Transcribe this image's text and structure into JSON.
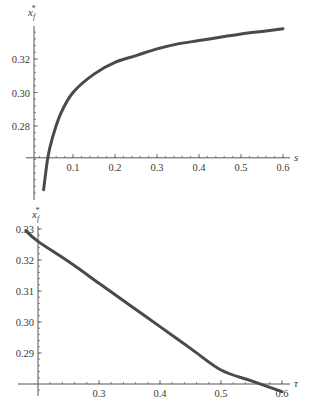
{
  "chart_data": [
    {
      "type": "line",
      "title": "",
      "xlabel": "s",
      "ylabel": "x_f^*",
      "xlim": [
        0.0,
        0.6
      ],
      "ylim": [
        0.24,
        0.34
      ],
      "axis_origin": {
        "x": 0.0,
        "y": 0.261
      },
      "x_ticks": [
        0.1,
        0.2,
        0.3,
        0.4,
        0.5,
        0.6
      ],
      "x_tick_labels": [
        "0.1",
        "0.2",
        "0.3",
        "0.4",
        "0.5",
        "0.6"
      ],
      "y_ticks": [
        0.28,
        0.3,
        0.32
      ],
      "y_tick_labels": [
        "0.28",
        "0.30",
        "0.32"
      ],
      "grid": false,
      "legend": null,
      "series": [
        {
          "name": "x_f^*(s)",
          "x": [
            0.03,
            0.04,
            0.05,
            0.07,
            0.1,
            0.15,
            0.2,
            0.25,
            0.3,
            0.35,
            0.4,
            0.45,
            0.5,
            0.55,
            0.6
          ],
          "y": [
            0.242,
            0.261,
            0.272,
            0.287,
            0.3,
            0.311,
            0.318,
            0.322,
            0.326,
            0.329,
            0.331,
            0.333,
            0.335,
            0.3365,
            0.338
          ]
        }
      ]
    },
    {
      "type": "line",
      "title": "",
      "xlabel": "τ",
      "ylabel": "x_f^*",
      "xlim": [
        0.18,
        0.6
      ],
      "ylim": [
        0.277,
        0.33
      ],
      "axis_origin": {
        "x": 0.2,
        "y": 0.28
      },
      "x_ticks": [
        0.3,
        0.4,
        0.5,
        0.6
      ],
      "x_tick_labels": [
        "0.3",
        "0.4",
        "0.5",
        "0.6"
      ],
      "y_ticks": [
        0.29,
        0.3,
        0.31,
        0.32,
        0.33
      ],
      "y_tick_labels": [
        "0.29",
        "0.30",
        "0.31",
        "0.32",
        "0.33"
      ],
      "grid": false,
      "legend": null,
      "series": [
        {
          "name": "x_f^*(τ)",
          "x": [
            0.18,
            0.2,
            0.25,
            0.3,
            0.35,
            0.4,
            0.45,
            0.5,
            0.55,
            0.6
          ],
          "y": [
            0.3295,
            0.326,
            0.3195,
            0.3125,
            0.3055,
            0.2985,
            0.2915,
            0.2845,
            0.281,
            0.2775
          ]
        }
      ]
    }
  ]
}
